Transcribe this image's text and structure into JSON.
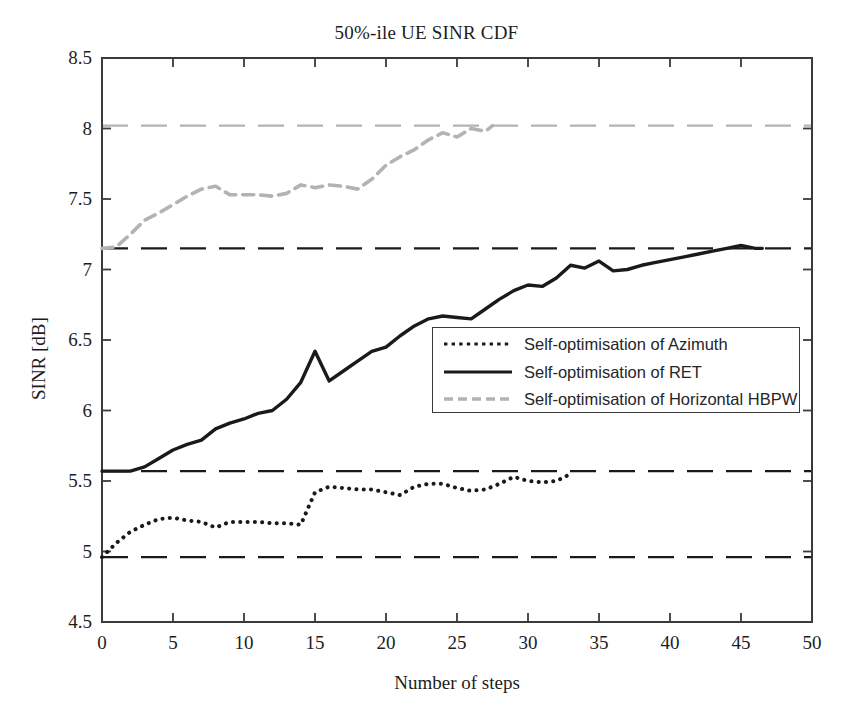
{
  "chart_data": {
    "type": "line",
    "title": "50%-ile UE SINR CDF",
    "xlabel": "Number of steps",
    "ylabel": "SINR [dB]",
    "xlim": [
      0,
      50
    ],
    "ylim": [
      4.5,
      8.5
    ],
    "xticks": [
      0,
      5,
      10,
      15,
      20,
      25,
      30,
      35,
      40,
      45,
      50
    ],
    "xtick_labels": [
      "0",
      "5",
      "10",
      "15",
      "20",
      "25",
      "30",
      "35",
      "40",
      "45",
      "50"
    ],
    "yticks": [
      4.5,
      5,
      5.5,
      6,
      6.5,
      7,
      7.5,
      8,
      8.5
    ],
    "ytick_labels": [
      "4.5",
      "5",
      "5.5",
      "6",
      "6.5",
      "7",
      "7.5",
      "8",
      "8.5"
    ],
    "grid": false,
    "legend_position": "center-right",
    "series": [
      {
        "name": "Self-optimisation of Azimuth",
        "style": "dotted",
        "color": "#1a1a1a",
        "x": [
          0,
          1,
          2,
          3,
          4,
          5,
          6,
          7,
          8,
          9,
          10,
          11,
          12,
          13,
          14,
          15,
          16,
          17,
          18,
          19,
          20,
          21,
          22,
          23,
          24,
          25,
          26,
          27,
          28,
          29,
          30,
          31,
          32,
          33
        ],
        "values": [
          4.96,
          5.06,
          5.14,
          5.19,
          5.23,
          5.24,
          5.22,
          5.21,
          5.17,
          5.21,
          5.21,
          5.21,
          5.2,
          5.2,
          5.19,
          5.42,
          5.46,
          5.45,
          5.44,
          5.44,
          5.42,
          5.4,
          5.46,
          5.48,
          5.48,
          5.45,
          5.43,
          5.44,
          5.48,
          5.53,
          5.5,
          5.49,
          5.5,
          5.55
        ]
      },
      {
        "name": "Self-optimisation of RET",
        "style": "solid",
        "color": "#1a1a1a",
        "x": [
          0,
          1,
          2,
          3,
          4,
          5,
          6,
          7,
          8,
          9,
          10,
          11,
          12,
          13,
          14,
          15,
          16,
          17,
          18,
          19,
          20,
          21,
          22,
          23,
          24,
          25,
          26,
          27,
          28,
          29,
          30,
          31,
          32,
          33,
          34,
          35,
          36,
          37,
          38,
          39,
          40,
          41,
          42,
          43,
          44,
          45,
          46,
          46.5
        ],
        "values": [
          5.57,
          5.57,
          5.57,
          5.6,
          5.66,
          5.72,
          5.76,
          5.79,
          5.87,
          5.91,
          5.94,
          5.98,
          6.0,
          6.08,
          6.2,
          6.42,
          6.21,
          6.28,
          6.35,
          6.42,
          6.45,
          6.53,
          6.6,
          6.65,
          6.67,
          6.66,
          6.65,
          6.72,
          6.79,
          6.85,
          6.89,
          6.88,
          6.94,
          7.03,
          7.01,
          7.06,
          6.99,
          7.0,
          7.03,
          7.05,
          7.07,
          7.09,
          7.11,
          7.13,
          7.15,
          7.17,
          7.15,
          7.15
        ]
      },
      {
        "name": "Self-optimisation of Horizontal HBPW",
        "style": "dashed",
        "color": "#b3b3b3",
        "x": [
          0,
          1,
          2,
          3,
          4,
          5,
          6,
          7,
          8,
          9,
          10,
          11,
          12,
          13,
          14,
          15,
          16,
          17,
          18,
          19,
          20,
          21,
          22,
          23,
          24,
          25,
          26,
          27,
          27.5
        ],
        "values": [
          7.15,
          7.16,
          7.25,
          7.35,
          7.4,
          7.46,
          7.52,
          7.57,
          7.59,
          7.53,
          7.53,
          7.53,
          7.52,
          7.54,
          7.6,
          7.58,
          7.6,
          7.59,
          7.57,
          7.64,
          7.74,
          7.8,
          7.85,
          7.92,
          7.97,
          7.94,
          8.0,
          7.98,
          8.02
        ]
      }
    ],
    "reference_lines": [
      {
        "name": "hbpw-upper-bound",
        "value": 8.02,
        "color": "#b3b3b3",
        "style": "dashed"
      },
      {
        "name": "ret-upper-bound",
        "value": 7.15,
        "color": "#1a1a1a",
        "style": "dashed"
      },
      {
        "name": "azimuth-upper-bound",
        "value": 5.57,
        "color": "#1a1a1a",
        "style": "dashed"
      },
      {
        "name": "azimuth-baseline",
        "value": 4.96,
        "color": "#1a1a1a",
        "style": "dashed"
      }
    ]
  },
  "legend": {
    "entries": [
      {
        "label": "Self-optimisation of Azimuth"
      },
      {
        "label": "Self-optimisation of RET"
      },
      {
        "label": "Self-optimisation of Horizontal HBPW"
      }
    ]
  }
}
